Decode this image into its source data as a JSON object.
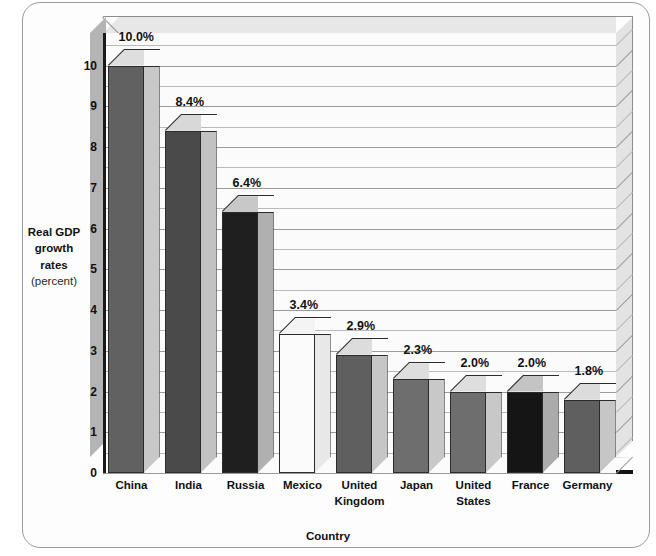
{
  "chart_data": {
    "type": "bar",
    "title": "",
    "xlabel": "Country",
    "ylabel": "Real GDP growth rates",
    "ylabel_unit": "(percent)",
    "ylim": [
      0,
      10.8
    ],
    "yticks": [
      0,
      1,
      2,
      3,
      4,
      5,
      6,
      7,
      8,
      9,
      10
    ],
    "ytick_labels": [
      "0",
      "1",
      "2",
      "3",
      "4",
      "5",
      "6",
      "7",
      "8",
      "9",
      "10"
    ],
    "gridline_interval": 0.5,
    "grid": true,
    "legend": "none",
    "three_d": true,
    "categories": [
      "China",
      "India",
      "Russia",
      "Mexico",
      "United Kingdom",
      "Japan",
      "United States",
      "France",
      "Germany"
    ],
    "values": [
      10.0,
      8.4,
      6.4,
      3.4,
      2.9,
      2.3,
      2.0,
      2.0,
      1.8
    ],
    "data_labels": [
      "10.0%",
      "8.4%",
      "6.4%",
      "3.4%",
      "2.9%",
      "2.3%",
      "2.0%",
      "2.0%",
      "1.8%"
    ],
    "bar_colors": [
      "#616161",
      "#4a4a4a",
      "#1f1f1f",
      "#fbfbfb",
      "#5f5f5f",
      "#6e6e6e",
      "#6e6e6e",
      "#151515",
      "#5f5f5f"
    ],
    "bar_side_colors": [
      "#c8c8c8",
      "#c2c2c2",
      "#b0b0b0",
      "#e8e8e8",
      "#c6c6c6",
      "#c8c8c8",
      "#c8c8c8",
      "#ababab",
      "#c6c6c6"
    ],
    "bar_top_colors": [
      "#dedede",
      "#d8d8d8",
      "#c8c8c8",
      "#f4f4f4",
      "#dcdcdc",
      "#dedede",
      "#dedede",
      "#c4c4c4",
      "#dcdcdc"
    ]
  },
  "axis": {
    "y_title_line1": "Real GDP",
    "y_title_line2": "growth",
    "y_title_line3": "rates",
    "y_title_unit": "(percent)",
    "x_title": "Country"
  },
  "colors": {
    "frame_border": "#9a9a9a",
    "gridline": "#9b9b9b",
    "axis_line": "#1a1a1a",
    "background": "#ffffff",
    "wall": "#fbfbfb",
    "floor": "#c9c9c9"
  }
}
